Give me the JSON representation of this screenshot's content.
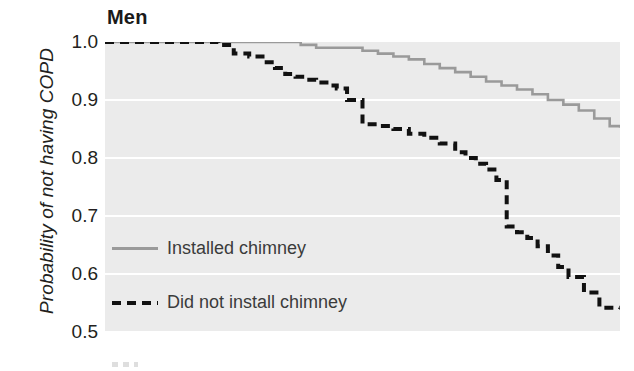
{
  "figure": {
    "title": "Men",
    "background_color": "#ffffff",
    "panel_color": "#ebebeb",
    "gridline_color": "#ffffff"
  },
  "axes": {
    "y_title": "Probability of not having COPD",
    "y_ticks": [
      "1.0",
      "0.9",
      "0.8",
      "0.7",
      "0.6",
      "0.5"
    ]
  },
  "legend": {
    "entries": [
      {
        "label": "Installed chimney",
        "style": "solid",
        "color": "#9a9a9a"
      },
      {
        "label": "Did not install chimney",
        "style": "dashed",
        "color": "#111111"
      }
    ]
  },
  "chart_data": {
    "type": "line",
    "subtype": "kaplan-meier-step",
    "title": "Men",
    "xlabel": "",
    "ylabel": "Probability of not having COPD",
    "ylim": [
      0.5,
      1.0
    ],
    "xlim": [
      0,
      100
    ],
    "ytick_labels": [
      "0.5",
      "0.6",
      "0.7",
      "0.8",
      "0.9",
      "1.0"
    ],
    "ytick_values": [
      0.5,
      0.6,
      0.7,
      0.8,
      0.9,
      1.0
    ],
    "xtick_labels": [],
    "grid": "horizontal-white",
    "legend_position": "inside-left-lower",
    "series": [
      {
        "name": "Installed chimney",
        "style": "solid",
        "color": "#9a9a9a",
        "x": [
          0,
          5,
          10,
          16,
          22,
          28,
          34,
          38,
          41,
          44,
          47,
          50,
          53,
          56,
          59,
          62,
          65,
          68,
          71,
          74,
          77,
          80,
          83,
          86,
          89,
          92,
          95,
          98,
          100
        ],
        "y": [
          1.0,
          1.0,
          1.0,
          1.0,
          1.0,
          1.0,
          1.0,
          0.995,
          0.99,
          0.99,
          0.99,
          0.985,
          0.98,
          0.975,
          0.97,
          0.962,
          0.955,
          0.948,
          0.94,
          0.932,
          0.925,
          0.918,
          0.91,
          0.9,
          0.892,
          0.882,
          0.868,
          0.855,
          0.852
        ]
      },
      {
        "name": "Did not install chimney",
        "style": "dashed",
        "color": "#111111",
        "x": [
          0,
          6,
          12,
          18,
          22,
          25,
          28,
          31,
          33,
          35,
          37,
          39,
          41,
          43,
          45,
          47,
          50,
          53,
          56,
          59,
          62,
          65,
          68,
          70,
          72,
          74,
          76,
          78,
          80,
          82,
          84,
          86,
          88,
          90,
          93,
          96,
          100
        ],
        "y": [
          1.0,
          1.0,
          1.0,
          1.0,
          0.995,
          0.98,
          0.975,
          0.965,
          0.955,
          0.945,
          0.94,
          0.935,
          0.93,
          0.925,
          0.92,
          0.9,
          0.858,
          0.855,
          0.85,
          0.842,
          0.835,
          0.825,
          0.81,
          0.8,
          0.79,
          0.78,
          0.762,
          0.682,
          0.672,
          0.662,
          0.648,
          0.632,
          0.612,
          0.595,
          0.568,
          0.542,
          0.54
        ]
      }
    ]
  }
}
